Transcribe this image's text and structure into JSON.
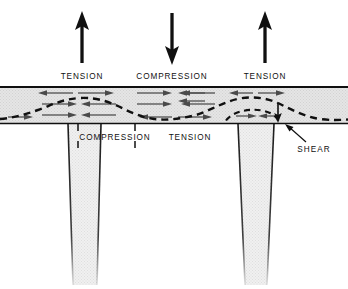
{
  "figure": {
    "type": "engineering-stress-diagram",
    "background_color": "#ffffff",
    "ink_color": "#101010",
    "slab_fill_color": "#e3e3e3",
    "column_fill_color": "#ececec",
    "stress_arrow_color": "#4a4a4a"
  },
  "top_load_arrows": [
    {
      "name": "tension-arrow-left",
      "direction": "up",
      "x": 82,
      "label": "TENSION"
    },
    {
      "name": "compression-arrow-center",
      "direction": "down",
      "x": 172,
      "label": "COMPRESSION"
    },
    {
      "name": "tension-arrow-right",
      "direction": "up",
      "x": 265,
      "label": "TENSION"
    }
  ],
  "top_labels": [
    {
      "text": "TENSION",
      "x": 82
    },
    {
      "text": "COMPRESSION",
      "x": 172
    },
    {
      "text": "TENSION",
      "x": 265
    }
  ],
  "bottom_labels": [
    {
      "text": "COMPRESSION",
      "x": 115
    },
    {
      "text": "TENSION",
      "x": 190
    }
  ],
  "callout": {
    "label": "SHEAR",
    "x": 314,
    "y": 148
  },
  "slab": {
    "top_y": 86,
    "bottom_y": 124,
    "left_x": 0,
    "right_x": 348
  },
  "neutral_axis": {
    "description": "dashed wavy neutral-axis curve through slab",
    "style": "dashed"
  },
  "columns": [
    {
      "name": "column-left",
      "top_x_left": 68,
      "top_x_right": 101,
      "top_y": 124
    },
    {
      "name": "column-right",
      "top_x_left": 238,
      "top_x_right": 274,
      "top_y": 124
    }
  ]
}
